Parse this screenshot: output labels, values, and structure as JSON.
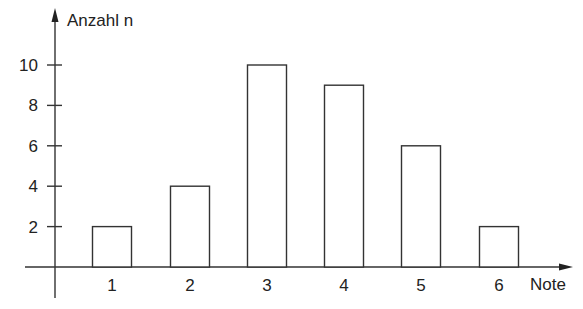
{
  "chart_data": {
    "type": "bar",
    "title": "",
    "xlabel": "Note",
    "ylabel": "Anzahl n",
    "categories": [
      "1",
      "2",
      "3",
      "4",
      "5",
      "6"
    ],
    "values": [
      2,
      4,
      10,
      9,
      6,
      2
    ],
    "yticks": [
      2,
      4,
      6,
      8,
      10
    ],
    "ylim": [
      0,
      11
    ],
    "grid": false,
    "legend": null,
    "bar_style": "outlined, white fill, black stroke"
  },
  "axes": {
    "x_label": "Note",
    "y_label": "Anzahl n",
    "y_tick_labels": [
      "2",
      "4",
      "6",
      "8",
      "10"
    ],
    "x_tick_labels": [
      "1",
      "2",
      "3",
      "4",
      "5",
      "6"
    ]
  },
  "colors": {
    "stroke": "#333333",
    "bar_fill": "#ffffff",
    "text": "#222222",
    "background": "#ffffff"
  }
}
